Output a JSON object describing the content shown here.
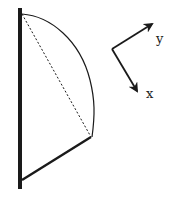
{
  "diagram": {
    "colors": {
      "stroke": "#1a1a1a",
      "background": "#ffffff"
    },
    "axes": {
      "x_label": "x",
      "y_label": "y"
    },
    "elements": [
      {
        "name": "wall",
        "type": "thick vertical line"
      },
      {
        "name": "arc-edge",
        "type": "curved boundary"
      },
      {
        "name": "chord",
        "type": "dashed line"
      },
      {
        "name": "bottom-edge",
        "type": "thick diagonal line"
      }
    ]
  }
}
